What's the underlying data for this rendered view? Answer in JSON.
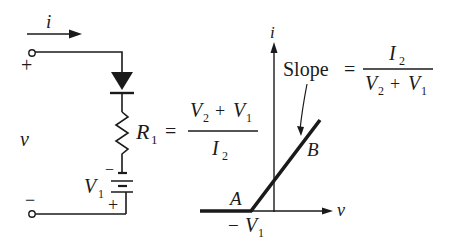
{
  "circuit": {
    "current_label": "i",
    "voltage_label": "v",
    "terminal_plus": "+",
    "terminal_minus": "−",
    "resistor_label": "R",
    "resistor_sub": "1",
    "equals": "=",
    "r_numerator_a": "V",
    "r_numerator_a_sub": "2",
    "r_numerator_op": "+",
    "r_numerator_b": "V",
    "r_numerator_b_sub": "1",
    "r_denominator": "I",
    "r_denominator_sub": "2",
    "battery_label": "V",
    "battery_sub": "1",
    "battery_minus": "−",
    "battery_plus": "+"
  },
  "graph": {
    "y_axis_label": "i",
    "x_axis_label": "v",
    "slope_word": "Slope",
    "equals": "=",
    "slope_numerator": "I",
    "slope_numerator_sub": "2",
    "slope_den_a": "V",
    "slope_den_a_sub": "2",
    "slope_den_op": "+",
    "slope_den_b": "V",
    "slope_den_b_sub": "1",
    "point_a": "A",
    "point_b": "B",
    "x_intercept_sign": "−",
    "x_intercept": "V",
    "x_intercept_sub": "1"
  }
}
